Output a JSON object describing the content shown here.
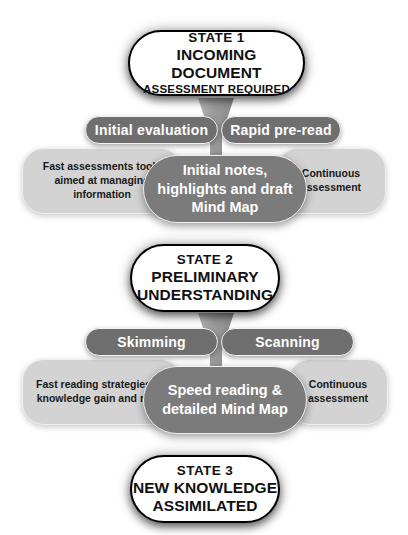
{
  "diagram": {
    "colors": {
      "background": "#ffffff",
      "state_box_fill": "#ffffff",
      "state_box_border": "#000000",
      "top_pill_fill": "#6f6f6f",
      "center_pill_fill": "#7b7b7b",
      "side_note_fill": "#d3d3d3",
      "funnel_fill": "#9a9a9a",
      "pill_text": "#ffffff",
      "note_text": "#1a1a1a"
    },
    "states": [
      {
        "id": "state-1",
        "line1": "STATE 1",
        "line2": "INCOMING DOCUMENT",
        "line3": "ASSESSMENT REQUIRED"
      },
      {
        "id": "state-2",
        "line1": "STATE 2",
        "line2": "PRELIMINARY",
        "line3": "UNDERSTANDING"
      },
      {
        "id": "state-3",
        "line1": "STATE 3",
        "line2": "NEW KNOWLEDGE",
        "line3": "ASSIMILATED"
      }
    ],
    "stages": [
      {
        "id": "stage-1",
        "left_pill": "Initial evaluation",
        "right_pill": "Rapid pre-read",
        "left_note": "Fast assessments tools aimed at managing information",
        "right_note": "Continuous assessment",
        "center": "Initial notes, highlights and draft Mind Map"
      },
      {
        "id": "stage-2",
        "left_pill": "Skimming",
        "right_pill": "Scanning",
        "left_note": "Fast reading strategies for knowledge gain and recall",
        "right_note": "Continuous assessment",
        "center": "Speed reading & detailed Mind Map"
      }
    ]
  }
}
